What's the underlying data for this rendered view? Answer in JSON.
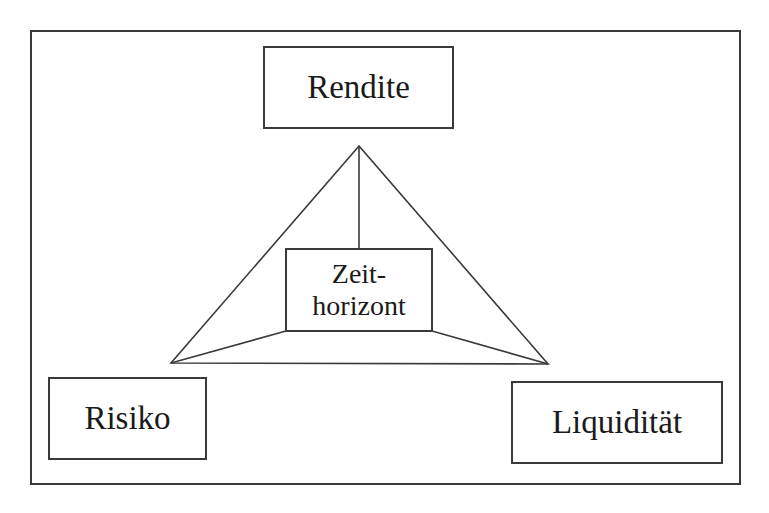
{
  "diagram": {
    "type": "triangle-concept-diagram",
    "nodes": {
      "top": {
        "label": "Rendite"
      },
      "bottom_left": {
        "label": "Risiko"
      },
      "bottom_right": {
        "label": "Liquidität"
      },
      "center": {
        "line1": "Zeit-",
        "line2": "horizont",
        "label": "Zeithorizont"
      }
    },
    "edges": [
      {
        "from": "Rendite",
        "to": "Risiko"
      },
      {
        "from": "Rendite",
        "to": "Liquidität"
      },
      {
        "from": "Risiko",
        "to": "Liquidität"
      },
      {
        "from": "Rendite",
        "to": "Zeithorizont"
      },
      {
        "from": "Risiko",
        "to": "Zeithorizont"
      },
      {
        "from": "Liquidität",
        "to": "Zeithorizont"
      }
    ],
    "colors": {
      "line": "#3a3a3a",
      "text": "#1a1a1a",
      "background": "#ffffff"
    }
  }
}
